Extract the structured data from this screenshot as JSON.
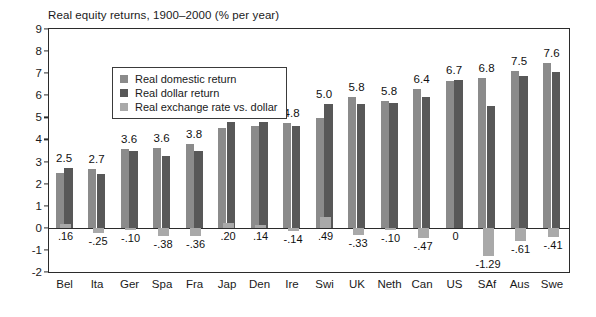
{
  "chart_data": {
    "type": "bar",
    "title": "Real equity returns, 1900–2000 (% per year)",
    "xlabel": "",
    "ylabel": "",
    "ylim": [
      -2,
      9
    ],
    "yticks": [
      9,
      8,
      7,
      6,
      5,
      4,
      3,
      2,
      1,
      0,
      -1,
      -2
    ],
    "ytick_labels": [
      "9",
      "8",
      "7",
      "6",
      "5",
      "4",
      "3",
      "2",
      "1",
      "0",
      "-1",
      "-2"
    ],
    "grid": false,
    "legend_position": "upper-left-inside",
    "categories": [
      "Bel",
      "Ita",
      "Ger",
      "Spa",
      "Fra",
      "Jap",
      "Den",
      "Ire",
      "Swi",
      "UK",
      "Neth",
      "Can",
      "US",
      "SAf",
      "Aus",
      "Swe"
    ],
    "series": [
      {
        "name": "Real domestic return",
        "color": "#8b8b8b",
        "values": [
          2.5,
          2.65,
          3.55,
          3.6,
          3.8,
          4.52,
          4.63,
          4.75,
          4.98,
          5.9,
          5.75,
          6.3,
          6.65,
          6.8,
          7.1,
          7.45
        ]
      },
      {
        "name": "Real dollar return",
        "color": "#585858",
        "values": [
          2.7,
          2.42,
          3.48,
          3.24,
          3.48,
          4.8,
          4.8,
          4.6,
          5.6,
          5.6,
          5.65,
          5.9,
          6.7,
          5.5,
          6.85,
          7.05
        ]
      },
      {
        "name": "Real exchange rate vs. dollar",
        "color": "#a9a9a9",
        "values": [
          0.16,
          -0.25,
          -0.1,
          -0.38,
          -0.36,
          0.2,
          0.14,
          -0.14,
          0.49,
          -0.33,
          -0.1,
          -0.47,
          0,
          -1.29,
          -0.61,
          -0.41
        ]
      }
    ],
    "top_labels": [
      "2.5",
      "2.7",
      "3.6",
      "3.6",
      "3.8",
      "4.5",
      "4.6",
      "4.8",
      "5.0",
      "5.8",
      "5.8",
      "6.4",
      "6.7",
      "6.8",
      "7.5",
      "7.6"
    ],
    "fx_labels": [
      ".16",
      "-.25",
      "-.10",
      "-.38",
      "-.36",
      ".20",
      ".14",
      "-.14",
      ".49",
      "-.33",
      "-.10",
      "-.47",
      "0",
      "-1.29",
      "-.61",
      "-.41"
    ]
  },
  "legend": {
    "items": [
      {
        "label": "Real domestic return",
        "color": "#8b8b8b"
      },
      {
        "label": "Real dollar return",
        "color": "#585858"
      },
      {
        "label": "Real exchange rate vs. dollar",
        "color": "#a9a9a9"
      }
    ]
  }
}
